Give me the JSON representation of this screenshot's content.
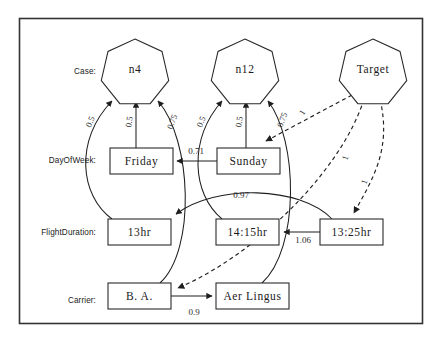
{
  "diagram": {
    "frame": {
      "x": 19,
      "y": 18,
      "w": 403,
      "h": 305
    },
    "row_labels": [
      {
        "id": "case",
        "text": "Case:",
        "x": 96,
        "y": 72
      },
      {
        "id": "dayofweek",
        "text": "DayOfWeek:",
        "x": 96,
        "y": 161
      },
      {
        "id": "flightduration",
        "text": "FlightDuration:",
        "x": 96,
        "y": 233
      },
      {
        "id": "carrier",
        "text": "Carrier:",
        "x": 96,
        "y": 301
      }
    ],
    "nodes": [
      {
        "id": "n4",
        "label": "n4",
        "shape": "heptagon",
        "cx": 135,
        "cy": 70,
        "r": 31
      },
      {
        "id": "n12",
        "label": "n12",
        "shape": "heptagon",
        "cx": 245,
        "cy": 70,
        "r": 31
      },
      {
        "id": "target",
        "label": "Target",
        "shape": "heptagon",
        "cx": 373,
        "cy": 70,
        "r": 31
      },
      {
        "id": "friday",
        "label": "Friday",
        "shape": "box",
        "x": 110,
        "y": 148,
        "w": 63,
        "h": 26
      },
      {
        "id": "sunday",
        "label": "Sunday",
        "shape": "box",
        "x": 217,
        "y": 148,
        "w": 63,
        "h": 26
      },
      {
        "id": "13hr",
        "label": "13hr",
        "shape": "box",
        "x": 108,
        "y": 219,
        "w": 63,
        "h": 26
      },
      {
        "id": "1415hr",
        "label": "14:15hr",
        "shape": "box",
        "x": 216,
        "y": 219,
        "w": 63,
        "h": 26
      },
      {
        "id": "1325hr",
        "label": "13:25hr",
        "shape": "box",
        "x": 320,
        "y": 219,
        "w": 63,
        "h": 26
      },
      {
        "id": "ba",
        "label": "B. A.",
        "shape": "box",
        "x": 108,
        "y": 283,
        "w": 63,
        "h": 26
      },
      {
        "id": "aerlingus",
        "label": "Aer Lingus",
        "shape": "box",
        "x": 216,
        "y": 283,
        "w": 73,
        "h": 26
      }
    ],
    "edges": [
      {
        "id": "e-13hr-n4",
        "from": "13hr",
        "to": "n4",
        "style": "solid",
        "weight": "0.5",
        "wx": 91,
        "wy": 122,
        "rot": -68
      },
      {
        "id": "e-friday-n4",
        "from": "friday",
        "to": "n4",
        "style": "solid",
        "weight": "0.5",
        "wx": 130,
        "wy": 122,
        "rot": -80
      },
      {
        "id": "e-ba-n4",
        "from": "ba",
        "to": "n4",
        "style": "solid",
        "weight": "0.75",
        "wx": 173,
        "wy": 122,
        "rot": -70
      },
      {
        "id": "e-1415hr-n12",
        "from": "1415hr",
        "to": "n12",
        "style": "solid",
        "weight": "0.5",
        "wx": 202,
        "wy": 122,
        "rot": -68
      },
      {
        "id": "e-sunday-n12",
        "from": "sunday",
        "to": "n12",
        "style": "solid",
        "weight": "0.5",
        "wx": 240,
        "wy": 122,
        "rot": -80
      },
      {
        "id": "e-aerlingus-n12",
        "from": "aerlingus",
        "to": "n12",
        "style": "solid",
        "weight": "0.75",
        "wx": 283,
        "wy": 120,
        "rot": -70
      },
      {
        "id": "e-sunday-friday",
        "from": "sunday",
        "to": "friday",
        "style": "solid",
        "weight": "0.71",
        "wx": 196,
        "wy": 152,
        "rot": 0
      },
      {
        "id": "e-1325hr-13hr",
        "from": "1325hr",
        "to": "13hr",
        "style": "solid",
        "weight": "0.97",
        "wx": 241,
        "wy": 196,
        "rot": 0
      },
      {
        "id": "e-1325hr-1415hr",
        "from": "1325hr",
        "to": "1415hr",
        "style": "solid",
        "weight": "1.06",
        "wx": 303,
        "wy": 240,
        "rot": 0
      },
      {
        "id": "e-ba-aerlingus",
        "from": "ba",
        "to": "aerlingus",
        "style": "solid",
        "weight": "0.9",
        "wx": 194,
        "wy": 312,
        "rot": 0
      },
      {
        "id": "e-target-sunday",
        "from": "target",
        "to": "sunday",
        "style": "dashed",
        "weight": "1",
        "wx": 303,
        "wy": 113,
        "rot": -58
      },
      {
        "id": "e-target-1325hr",
        "from": "target",
        "to": "1325hr",
        "style": "dashed",
        "weight": "1",
        "wx": 346,
        "wy": 158,
        "rot": -72
      },
      {
        "id": "e-target-ba",
        "from": "target",
        "to": "ba",
        "style": "dashed",
        "weight": "1",
        "wx": 365,
        "wy": 182,
        "rot": -72
      }
    ]
  }
}
